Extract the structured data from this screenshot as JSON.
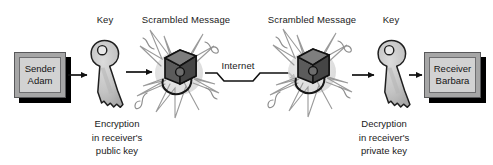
{
  "diagram": {
    "width": 493,
    "height": 165,
    "background": "#ffffff",
    "stroke_color": "#1a1a1a",
    "key_fill": "#c2c2c2",
    "box_frame_fill": "#a6a6a6",
    "box_panel_fill": "#d2d2d2",
    "shadow_color": "#000000"
  },
  "sender": {
    "line1": "Sender",
    "line2": "Adam"
  },
  "receiver": {
    "line1": "Receiver",
    "line2": "Barbara"
  },
  "labels": {
    "key_left": "Key",
    "key_right": "Key",
    "scrambled_left": "Scrambled Message",
    "scrambled_right": "Scrambled Message",
    "internet": "Internet"
  },
  "captions": {
    "encryption": {
      "line1": "Encryption",
      "line2": "in receiver's",
      "line3": "public key"
    },
    "decryption": {
      "line1": "Decryption",
      "line2": "in receiver's",
      "line3": "private key"
    }
  },
  "icons": {
    "key_left": "key-icon",
    "key_right": "key-icon",
    "scrambled_left": "scrambled-message-icon",
    "scrambled_right": "scrambled-message-icon",
    "arrow1": "arrow-right-icon",
    "arrow2": "arrow-right-icon",
    "arrow3": "arrow-right-icon",
    "arrow4": "arrow-right-icon",
    "internet_path": "zigzag-network-path-icon"
  }
}
